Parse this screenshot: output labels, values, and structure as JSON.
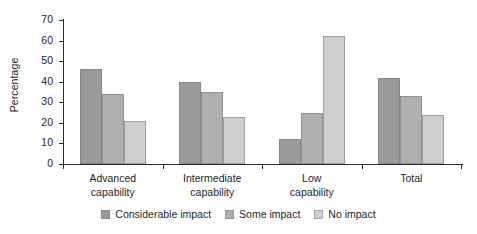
{
  "chart_data": {
    "type": "bar",
    "title": "",
    "subtitle": "",
    "xlabel": "",
    "ylabel": "Percentage",
    "ylim": [
      0,
      70
    ],
    "yticks": [
      0,
      10,
      20,
      30,
      40,
      50,
      60,
      70
    ],
    "grid": false,
    "legend_position": "bottom-center",
    "orientation": "vertical",
    "grouped": true,
    "categories": [
      "Advanced\ncapability",
      "Intermediate\ncapability",
      "Low\ncapability",
      "Total"
    ],
    "category_lines": [
      [
        "Advanced",
        "capability"
      ],
      [
        "Intermediate",
        "capability"
      ],
      [
        "Low",
        "capability"
      ],
      [
        "Total",
        ""
      ]
    ],
    "series": [
      {
        "name": "Considerable impact",
        "color": "#9a9a9a",
        "values": [
          46,
          40,
          12,
          42
        ]
      },
      {
        "name": "Some impact",
        "color": "#b0b0b0",
        "values": [
          34,
          35,
          25,
          33
        ]
      },
      {
        "name": "No impact",
        "color": "#cfcfcf",
        "values": [
          21,
          23,
          62,
          24
        ]
      }
    ]
  },
  "axis": {
    "y_title": "Percentage",
    "tick_labels": [
      "70",
      "60",
      "50",
      "40",
      "30",
      "20",
      "10",
      "0"
    ]
  },
  "legend": {
    "items": [
      {
        "label": "Considerable impact"
      },
      {
        "label": "Some impact"
      },
      {
        "label": "No impact"
      }
    ]
  },
  "colors": {
    "series_1": "#9a9a9a",
    "series_2": "#b0b0b0",
    "series_3": "#cfcfcf",
    "axis": "#2b2b2b",
    "text": "#1f1f1f",
    "background": "#ffffff"
  }
}
